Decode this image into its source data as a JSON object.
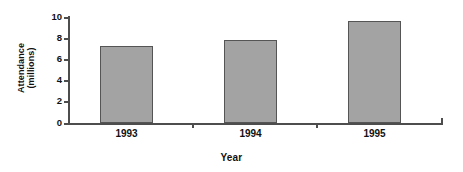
{
  "chart_data": {
    "type": "bar",
    "title": "",
    "subtitle": "",
    "xlabel": "Year",
    "ylabel": "Attendance (millions)",
    "ylabel_lines": [
      "Attendance",
      "(millions)"
    ],
    "categories": [
      "1993",
      "1994",
      "1995"
    ],
    "values": [
      7.2,
      7.75,
      9.5
    ],
    "series": [
      {
        "name": "Attendance",
        "values": [
          7.2,
          7.75,
          9.5
        ]
      }
    ],
    "ylim": [
      0,
      10
    ],
    "xlim": [
      0,
      3
    ],
    "y_ticks": [
      0,
      2,
      4,
      6,
      8,
      10
    ],
    "y_tick_labels": [
      "0",
      "2",
      "4",
      "6",
      "8",
      "10"
    ],
    "grid": false,
    "legend": false,
    "legend_position": "none",
    "annotations": [],
    "colors": {
      "bar_fill": "#a3a3a3",
      "bar_border": "#555555",
      "axis": "#4d4d4d",
      "text": "#111111",
      "background": "#ffffff"
    }
  }
}
